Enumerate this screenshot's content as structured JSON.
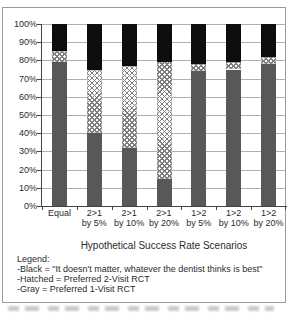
{
  "figure": {
    "legend": {
      "heading": "Legend:",
      "items": [
        "-Black = \"It doesn't matter, whatever the dentist thinks is best\"",
        "-Hatched = Preferred 2-Visit RCT",
        "-Gray = Preferred 1-Visit RCT"
      ]
    }
  },
  "chart_data": {
    "type": "bar",
    "stacked": true,
    "title": "",
    "xlabel": "Hypothetical Success Rate Scenarios",
    "ylabel": "",
    "ylim": [
      0,
      100
    ],
    "grid": true,
    "legend_position": "below",
    "categories": [
      "Equal",
      "2>1 by 5%",
      "2>1 by 10%",
      "2>1 by 20%",
      "1>2 by 5%",
      "1>2 by 10%",
      "1>2 by 20%"
    ],
    "x_tick_lines": [
      [
        "Equal",
        ""
      ],
      [
        "2>1",
        "by 5%"
      ],
      [
        "2>1",
        "by 10%"
      ],
      [
        "2>1",
        "by 20%"
      ],
      [
        "1>2",
        "by 5%"
      ],
      [
        "1>2",
        "by 10%"
      ],
      [
        "1>2",
        "by 20%"
      ]
    ],
    "y_ticks": [
      "100%",
      "90%",
      "80%",
      "70%",
      "60%",
      "50%",
      "40%",
      "30%",
      "20%",
      "10%",
      "0%"
    ],
    "series": [
      {
        "name": "Gray",
        "label": "Preferred 1-Visit RCT",
        "pattern": "solid",
        "color": "#585858",
        "values": [
          79,
          40,
          32,
          15,
          74,
          75,
          78
        ]
      },
      {
        "name": "Hatched",
        "label": "Preferred 2-Visit RCT",
        "pattern": "crosshatch",
        "color": "#fdfdfd",
        "values": [
          6,
          35,
          45,
          64,
          4,
          4,
          4
        ]
      },
      {
        "name": "Black",
        "label": "It doesn't matter, whatever the dentist thinks is best",
        "pattern": "solid",
        "color": "#0d0d0d",
        "values": [
          15,
          25,
          23,
          21,
          22,
          21,
          18
        ]
      }
    ],
    "colors": {
      "grid": "#b0b0b0",
      "axis": "#444444",
      "frame_border": "#9a9a9a",
      "background": "#ffffff"
    }
  }
}
